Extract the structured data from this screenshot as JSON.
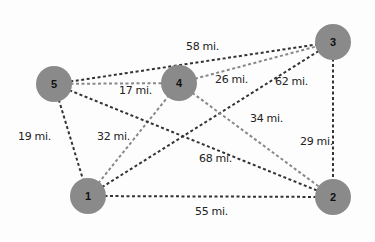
{
  "nodes": [
    {
      "id": "1",
      "label": "1",
      "x": 88,
      "y": 196
    },
    {
      "id": "2",
      "label": "2",
      "x": 333,
      "y": 197
    },
    {
      "id": "3",
      "label": "3",
      "x": 333,
      "y": 42
    },
    {
      "id": "4",
      "label": "4",
      "x": 179,
      "y": 83
    },
    {
      "id": "5",
      "label": "5",
      "x": 54,
      "y": 84
    }
  ],
  "edges": [
    {
      "from": "5",
      "to": "3",
      "label": "58 mi.",
      "color": "#333333"
    },
    {
      "from": "5",
      "to": "4",
      "label": "17 mi.",
      "color": "#888888"
    },
    {
      "from": "4",
      "to": "3",
      "label": "26 mi.",
      "color": "#888888"
    },
    {
      "from": "1",
      "to": "3",
      "label": "62 mi.",
      "color": "#333333"
    },
    {
      "from": "5",
      "to": "1",
      "label": "19 mi.",
      "color": "#333333"
    },
    {
      "from": "1",
      "to": "4",
      "label": "32 mi.",
      "color": "#888888"
    },
    {
      "from": "4",
      "to": "2",
      "label": "34 mi.",
      "color": "#888888"
    },
    {
      "from": "5",
      "to": "2",
      "label": "68 mi.",
      "color": "#333333"
    },
    {
      "from": "3",
      "to": "2",
      "label": "29 mi.",
      "color": "#333333"
    },
    {
      "from": "1",
      "to": "2",
      "label": "55 mi.",
      "color": "#333333"
    }
  ],
  "labels": {
    "e53": "58 mi.",
    "e54": "17 mi.",
    "e43": "26 mi.",
    "e13": "62 mi.",
    "e51": "19 mi.",
    "e14": "32 mi.",
    "e42": "34 mi.",
    "e52": "68 mi.",
    "e32": "29 mi.",
    "e12": "55 mi."
  },
  "node_labels": {
    "n1": "1",
    "n2": "2",
    "n3": "3",
    "n4": "4",
    "n5": "5"
  }
}
